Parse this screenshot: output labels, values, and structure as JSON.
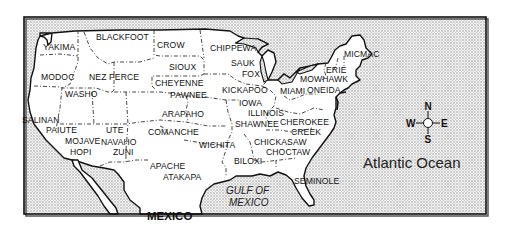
{
  "map": {
    "title": "Native American Tribes of the United States",
    "colors": {
      "land": "#ffffff",
      "water_pattern": "#bdbdbd",
      "frame": "#111111",
      "text": "#111111"
    },
    "tribes": [
      {
        "name": "YAKIMA",
        "x": 43,
        "y": 50
      },
      {
        "name": "BLACKFOOT",
        "x": 96,
        "y": 40
      },
      {
        "name": "CROW",
        "x": 157,
        "y": 48
      },
      {
        "name": "CHIPPEWA",
        "x": 210,
        "y": 51
      },
      {
        "name": "SIOUX",
        "x": 169,
        "y": 70
      },
      {
        "name": "SAUK",
        "x": 231,
        "y": 66
      },
      {
        "name": "FOX",
        "x": 242,
        "y": 77
      },
      {
        "name": "MODOC",
        "x": 41,
        "y": 80
      },
      {
        "name": "NEZ PERCE",
        "x": 89,
        "y": 80
      },
      {
        "name": "CHEYENNE",
        "x": 155,
        "y": 86
      },
      {
        "name": "PAWNEE",
        "x": 170,
        "y": 98
      },
      {
        "name": "KICKAPOO",
        "x": 222,
        "y": 93
      },
      {
        "name": "MIAMI",
        "x": 280,
        "y": 94
      },
      {
        "name": "WASHO",
        "x": 65,
        "y": 97
      },
      {
        "name": "IOWA",
        "x": 239,
        "y": 106
      },
      {
        "name": "ILLINOIS",
        "x": 248,
        "y": 116
      },
      {
        "name": "ARAPAHO",
        "x": 162,
        "y": 117
      },
      {
        "name": "SHAWNEE",
        "x": 235,
        "y": 127
      },
      {
        "name": "SALINAN",
        "x": 22,
        "y": 123
      },
      {
        "name": "PAIUTE",
        "x": 46,
        "y": 133
      },
      {
        "name": "UTE",
        "x": 106,
        "y": 133
      },
      {
        "name": "COMANCHE",
        "x": 148,
        "y": 135
      },
      {
        "name": "MOJAVE",
        "x": 65,
        "y": 144
      },
      {
        "name": "NAVAHO",
        "x": 101,
        "y": 145
      },
      {
        "name": "HOPI",
        "x": 70,
        "y": 155
      },
      {
        "name": "ZUNI",
        "x": 113,
        "y": 155
      },
      {
        "name": "WICHITA",
        "x": 199,
        "y": 148
      },
      {
        "name": "CHEROKEE",
        "x": 280,
        "y": 125
      },
      {
        "name": "CREEK",
        "x": 291,
        "y": 135
      },
      {
        "name": "CHICKASAW",
        "x": 254,
        "y": 145
      },
      {
        "name": "CHOCTAW",
        "x": 266,
        "y": 155
      },
      {
        "name": "BILOXI",
        "x": 234,
        "y": 164
      },
      {
        "name": "APACHE",
        "x": 150,
        "y": 169
      },
      {
        "name": "ATAKAPA",
        "x": 163,
        "y": 180
      },
      {
        "name": "SEMINOLE",
        "x": 294,
        "y": 184
      },
      {
        "name": "MICMAC",
        "x": 344,
        "y": 57
      },
      {
        "name": "ERIE",
        "x": 326,
        "y": 73
      },
      {
        "name": "MOWHAWK",
        "x": 300,
        "y": 82
      },
      {
        "name": "ONEIDA",
        "x": 307,
        "y": 93
      }
    ],
    "water_labels": {
      "atlantic": "Atlantic Ocean",
      "gulf_line1": "GULF OF",
      "gulf_line2": "MEXICO"
    },
    "country_labels": {
      "mexico": "MEXICO"
    },
    "compass": {
      "north": "N",
      "south": "S",
      "east": "E",
      "west": "W"
    }
  }
}
